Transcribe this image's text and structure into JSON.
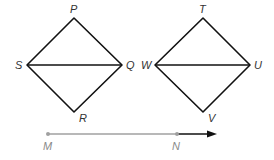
{
  "figure_a": {
    "vertices": {
      "P": {
        "label": "P",
        "x": 74,
        "y": 18
      },
      "Q": {
        "label": "Q",
        "x": 122,
        "y": 65
      },
      "R": {
        "label": "R",
        "x": 74,
        "y": 112
      },
      "S": {
        "label": "S",
        "x": 27,
        "y": 65
      }
    },
    "segments": [
      "SP",
      "PQ",
      "QR",
      "RS",
      "SQ"
    ]
  },
  "figure_b": {
    "vertices": {
      "T": {
        "label": "T",
        "x": 203,
        "y": 18
      },
      "U": {
        "label": "U",
        "x": 250,
        "y": 65
      },
      "V": {
        "label": "V",
        "x": 203,
        "y": 112
      },
      "W": {
        "label": "W",
        "x": 155,
        "y": 65
      }
    },
    "segments": [
      "WT",
      "TU",
      "UV",
      "VW",
      "WU"
    ]
  },
  "ray": {
    "start": {
      "label": "M",
      "x": 48,
      "y": 134
    },
    "through": {
      "label": "N",
      "x": 177,
      "y": 134
    },
    "arrow_end_x": 217
  },
  "colors": {
    "figure_stroke": "#111111",
    "ray_segment": "#a0a0a0",
    "ray_arrow": "#111111",
    "label_dark": "#333333",
    "label_gray": "#8a8a8a"
  }
}
